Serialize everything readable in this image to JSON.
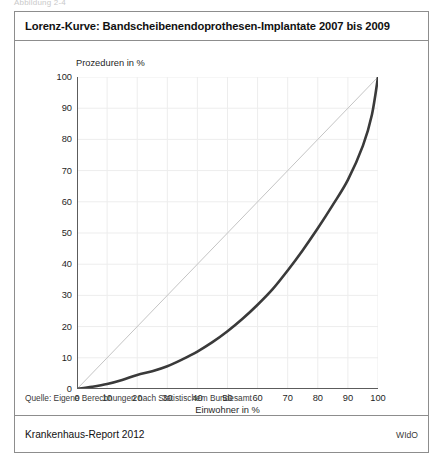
{
  "figure": {
    "number_label": "Abbildung 2-4",
    "title": "Lorenz-Kurve: Bandscheibenendoprothesen-Implantate 2007 bis 2009",
    "source": "Quelle: Eigene Berechnungen nach Statistischem Bundesamt",
    "footer_left": "Krankenhaus-Report 2012",
    "footer_right": "WIdO"
  },
  "colors": {
    "curve": "#3a3a3a",
    "equality_line": "#c4c4c4",
    "grid": "#ededed",
    "axis": "#5c5c5c",
    "border": "#8d8d8d"
  },
  "chart_data": {
    "type": "line",
    "title": "Lorenz-Kurve: Bandscheibenendoprothesen-Implantate 2007 bis 2009",
    "xlabel": "Einwohner in %",
    "ylabel": "Prozeduren in %",
    "xlim": [
      0,
      100
    ],
    "ylim": [
      0,
      100
    ],
    "xticks": [
      0,
      10,
      20,
      30,
      40,
      50,
      60,
      70,
      80,
      90,
      100
    ],
    "yticks": [
      0,
      10,
      20,
      30,
      40,
      50,
      60,
      70,
      80,
      90,
      100
    ],
    "grid": true,
    "legend": "none",
    "series": [
      {
        "name": "Lorenz-Kurve",
        "color": "#3a3a3a",
        "x": [
          0,
          5,
          10,
          15,
          20,
          25,
          30,
          35,
          40,
          45,
          50,
          55,
          60,
          65,
          70,
          75,
          80,
          85,
          90,
          95,
          98,
          100
        ],
        "values": [
          0,
          0.7,
          1.6,
          2.9,
          4.5,
          5.7,
          7.3,
          9.5,
          12.0,
          15.0,
          18.5,
          22.5,
          27.0,
          32.0,
          38.0,
          44.5,
          51.5,
          59.0,
          67.0,
          78.0,
          88.0,
          100
        ]
      },
      {
        "name": "Gleichverteilungsgerade",
        "color": "#c4c4c4",
        "x": [
          0,
          100
        ],
        "values": [
          0,
          100
        ]
      }
    ]
  }
}
